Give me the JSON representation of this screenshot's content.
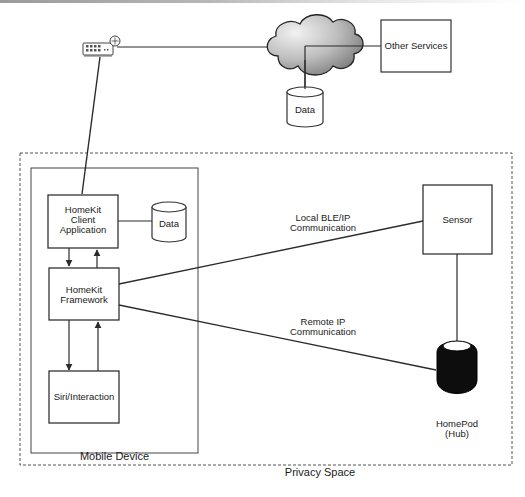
{
  "diagram": {
    "nodes": {
      "router": {
        "icon": "router-icon"
      },
      "cloud": {
        "icon": "cloud-icon"
      },
      "other_services": {
        "label": "Other Services"
      },
      "cloud_data": {
        "label": "Data"
      },
      "client_app": {
        "label_l1": "HomeKit",
        "label_l2": "Client",
        "label_l3": "Application"
      },
      "local_data": {
        "label": "Data"
      },
      "framework": {
        "label_l1": "HomeKit",
        "label_l2": "Framework"
      },
      "siri": {
        "label": "Siri/Interaction"
      },
      "sensor": {
        "label": "Sensor"
      },
      "homepod": {
        "label_l1": "HomePod",
        "label_l2": "(Hub)"
      }
    },
    "containers": {
      "mobile_device": {
        "label": "Mobile Device"
      },
      "privacy_space": {
        "label": "Privacy Space"
      }
    },
    "edges": {
      "local": {
        "label_l1": "Local BLE/IP",
        "label_l2": "Communication"
      },
      "remote": {
        "label_l1": "Remote IP",
        "label_l2": "Communication"
      }
    },
    "colors": {
      "line": "#2b2b2b",
      "dashed": "#555555",
      "homepod_fill": "#0d0d0d",
      "cloud_light": "#e8e8e8",
      "cloud_dark": "#8a8a8a"
    }
  }
}
